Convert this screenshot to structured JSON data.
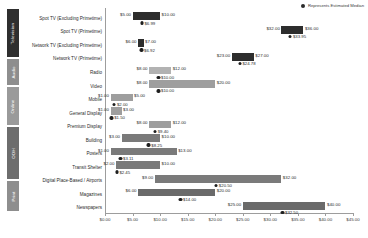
{
  "legend": {
    "icon": "median-dot-icon",
    "label": "Represents Estimated Median"
  },
  "groups": [
    {
      "key": "tv",
      "label": "Television",
      "color": "#2f2f2f"
    },
    {
      "key": "audio",
      "label": "Audio",
      "color": "#8e8e8e"
    },
    {
      "key": "online",
      "label": "Online",
      "color": "#9a9a9a"
    },
    {
      "key": "ooh",
      "label": "OOH",
      "color": "#6d6d6d"
    },
    {
      "key": "print",
      "label": "Print",
      "color": "#8e8e8e"
    }
  ],
  "axis": {
    "ticks": [
      "$0.00",
      "$5.00",
      "$10.00",
      "$15.00",
      "$20.00",
      "$25.00",
      "$30.00",
      "$35.00",
      "$40.00",
      "$45.00"
    ]
  },
  "chart_data": {
    "type": "bar",
    "title": "",
    "xlabel": "",
    "ylabel": "",
    "xlim": [
      0,
      45
    ],
    "grid": false,
    "legend_position": "top-right",
    "categories": [
      "Spot TV (Excluding Primetime)",
      "Spot TV (Primetime)",
      "Network TV (Excluding Primetime)",
      "Network TV (Primetime)",
      "Radio",
      "Video",
      "Mobile",
      "General Display",
      "Premium Display",
      "Building",
      "Posters",
      "Transit Shelter",
      "Digital Place-Based / Airports",
      "Magazines",
      "Newspapers"
    ],
    "series": [
      {
        "name": "Low",
        "values": [
          5.0,
          32.0,
          6.0,
          23.0,
          8.0,
          8.0,
          1.0,
          1.0,
          8.0,
          3.0,
          1.0,
          2.0,
          9.0,
          6.0,
          25.0
        ]
      },
      {
        "name": "High",
        "values": [
          10.0,
          36.0,
          7.0,
          27.0,
          12.0,
          20.0,
          5.0,
          3.0,
          12.0,
          10.0,
          13.0,
          10.0,
          32.0,
          20.0,
          40.0
        ]
      },
      {
        "name": "Estimated Median",
        "values": [
          6.99,
          33.95,
          6.92,
          24.78,
          10.0,
          10.0,
          2.0,
          1.5,
          9.4,
          8.25,
          3.11,
          2.45,
          20.5,
          14.0,
          32.5
        ]
      }
    ],
    "low_labels": [
      "$5.00",
      "$32.00",
      "$6.00",
      "$23.00",
      "$8.00",
      "$8.00",
      "$1.00",
      "$1.00",
      "$8.00",
      "$3.00",
      "$1.00",
      "$2.00",
      "$9.00",
      "$6.00",
      "$25.00"
    ],
    "high_labels": [
      "$10.00",
      "$36.00",
      "$7.00",
      "$27.00",
      "$12.00",
      "$20.00",
      "$5.00",
      "$3.00",
      "$12.00",
      "$10.00",
      "$13.00",
      "$10.00",
      "$32.00",
      "$20.00",
      "$40.00"
    ],
    "median_labels": [
      "$6.99",
      "$33.95",
      "$6.92",
      "$24.78",
      "$10.00",
      "$10.00",
      "$2.00",
      "$1.50",
      "$9.40",
      "$8.25",
      "$3.11",
      "$2.45",
      "$20.50",
      "$14.00",
      "$32.50"
    ],
    "group_of": [
      "tv",
      "tv",
      "tv",
      "tv",
      "audio",
      "online",
      "online",
      "online",
      "online",
      "ooh",
      "ooh",
      "ooh",
      "ooh",
      "print",
      "print"
    ]
  }
}
